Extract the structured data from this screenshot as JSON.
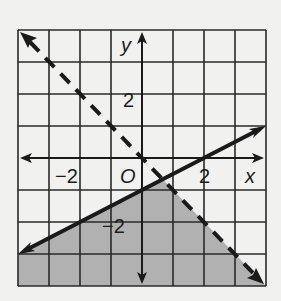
{
  "graph": {
    "x_range": [
      -4,
      4
    ],
    "y_range": [
      -4,
      4
    ],
    "axis_labels": {
      "x": "x",
      "y": "y",
      "origin": "O"
    },
    "tick_labels": [
      {
        "text": "2",
        "axis": "y",
        "value": 2
      },
      {
        "text": "−2",
        "axis": "y",
        "value": -2
      },
      {
        "text": "2",
        "axis": "x",
        "value": 2
      },
      {
        "text": "−2",
        "axis": "x",
        "value": -2
      }
    ],
    "colors": {
      "grid": "#2a2a2a",
      "line": "#1a1a1a",
      "shade": "#aaaaaa",
      "background": "#f1f1ef"
    },
    "lines": [
      {
        "name": "solid-boundary",
        "equation": "y = 0.5x - 1",
        "style": "solid",
        "from": [
          -4,
          -3
        ],
        "to": [
          4,
          1
        ]
      },
      {
        "name": "dashed-boundary",
        "equation": "y = -x",
        "style": "dashed",
        "from": [
          -4,
          4
        ],
        "to": [
          4,
          -4
        ]
      }
    ],
    "shaded_region": "y ≤ 0.5x − 1 and y < −x"
  }
}
